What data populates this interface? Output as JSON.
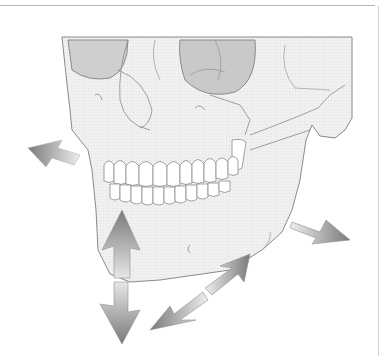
{
  "figure": {
    "arrows": [
      {
        "name": "arrow-forward-left",
        "direction": "up-left"
      },
      {
        "name": "arrow-vertical-up",
        "direction": "up"
      },
      {
        "name": "arrow-vertical-down",
        "direction": "down"
      },
      {
        "name": "arrow-diagonal-double",
        "direction": "down-left-and-up-right"
      },
      {
        "name": "arrow-backward-right",
        "direction": "down-right"
      }
    ],
    "colors": {
      "bone_fill": "#efefef",
      "bone_outline": "#8a8a8a",
      "orbit_fill": "#c9c9c9",
      "arrow_dark": "#7a7a7a",
      "arrow_light": "#e8e8e8",
      "background": "#ffffff"
    }
  }
}
